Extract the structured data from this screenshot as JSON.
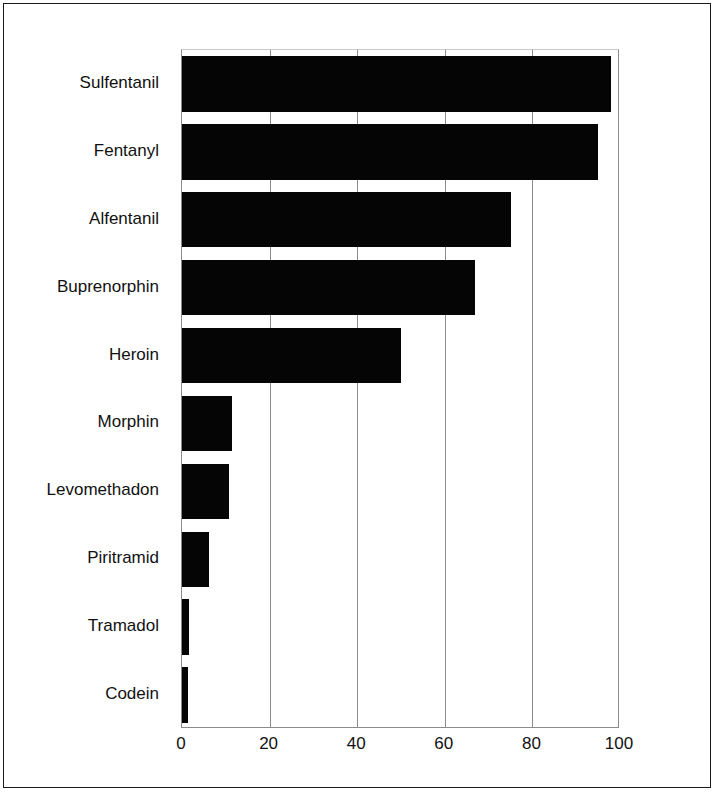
{
  "figure": {
    "background_color": "#ffffff",
    "border_color": "#1b1b1b",
    "bar_color": "#050505",
    "grid_color": "#8b8b8b",
    "axis_color": "#8b8b8b"
  },
  "chart_data": {
    "type": "bar",
    "orientation": "horizontal",
    "title": "",
    "subtitle": "",
    "xlabel": "",
    "ylabel": "",
    "xlim": [
      0,
      100
    ],
    "xticks": [
      0,
      20,
      40,
      60,
      80,
      100
    ],
    "xtick_labels": [
      "0",
      "20",
      "40",
      "60",
      "80",
      "100"
    ],
    "grid": "vertical",
    "legend": "none",
    "categories": [
      "Sulfentanil",
      "Fentanyl",
      "Alfentanil",
      "Buprenorphin",
      "Heroin",
      "Morphin",
      "Levomethadon",
      "Piritramid",
      "Tramadol",
      "Codein"
    ],
    "values": [
      98,
      95,
      75,
      67,
      50,
      11.4,
      10.7,
      6.1,
      1.6,
      1.3
    ],
    "series": [
      {
        "name": "",
        "values": [
          98,
          95,
          75,
          67,
          50,
          11.4,
          10.7,
          6.1,
          1.6,
          1.3
        ]
      }
    ]
  }
}
